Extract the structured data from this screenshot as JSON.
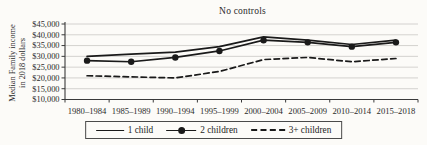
{
  "title": "No controls",
  "y_axis_title": {
    "line1": "Median Family income",
    "line2": "in 2018 dollars"
  },
  "chart_data": {
    "type": "line",
    "title": "No controls",
    "xlabel": "",
    "ylabel": "Median Family income in 2018 dollars",
    "ylim": [
      10000,
      45000
    ],
    "y_tick_step": 5000,
    "y_tick_labels": [
      "$10,000",
      "$15,000",
      "$20,000",
      "$25,000",
      "$30,000",
      "$35,000",
      "$40,000",
      "$45,000"
    ],
    "grid": "horizontal",
    "legend_position": "bottom",
    "categories": [
      "1980–1984",
      "1985–1989",
      "1990–1994",
      "1995–1999",
      "2000–2004",
      "2005–2009",
      "2010–2014",
      "2015–2018"
    ],
    "series": [
      {
        "name": "1 child",
        "style": "solid",
        "values": [
          30000,
          31000,
          32000,
          34500,
          39000,
          37500,
          35500,
          37500
        ]
      },
      {
        "name": "2 children",
        "style": "solid-marker",
        "values": [
          28000,
          27500,
          29500,
          32500,
          37500,
          36500,
          34500,
          36500
        ]
      },
      {
        "name": "3+ children",
        "style": "dashed",
        "values": [
          21000,
          20500,
          20000,
          23000,
          28500,
          29500,
          27500,
          29000
        ]
      }
    ],
    "colors": {
      "line": "#1a1a1a",
      "grid": "#c9c8c4",
      "axis": "#3a3a3a",
      "text": "#2a2a2a",
      "background": "#fcfbf8"
    }
  }
}
